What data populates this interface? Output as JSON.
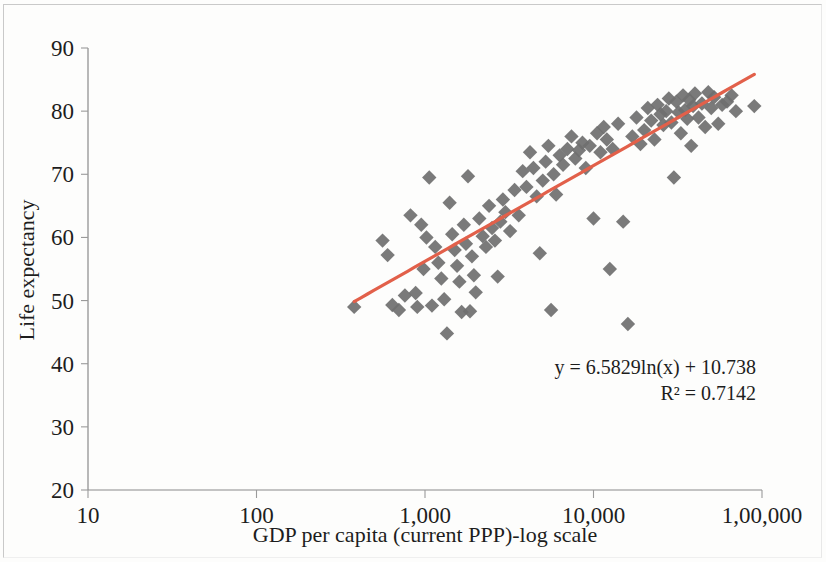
{
  "chart_data": {
    "type": "scatter",
    "title": "",
    "xlabel": "GDP per capita (current PPP)-log scale",
    "ylabel": "Life expectancy",
    "xscale": "log",
    "yscale": "linear",
    "xlim": [
      10,
      100000
    ],
    "ylim": [
      20,
      90
    ],
    "xticks": [
      10,
      100,
      1000,
      10000,
      100000
    ],
    "xtick_labels": [
      "10",
      "100",
      "1,000",
      "10,000",
      "1,00,000"
    ],
    "yticks": [
      20,
      30,
      40,
      50,
      60,
      70,
      80,
      90
    ],
    "ytick_labels": [
      "20",
      "30",
      "40",
      "50",
      "60",
      "70",
      "80",
      "90"
    ],
    "grid": false,
    "legend": null,
    "marker_shape": "diamond",
    "marker_color": "#6f6f6f",
    "trendline": {
      "type": "logarithmic",
      "equation": "y = 6.5829ln(x) + 10.738",
      "r_squared_label": "R² = 0.7142",
      "r_squared": 0.7142,
      "slope": 6.5829,
      "intercept": 10.738,
      "color": "#e2604a",
      "x_start": 380,
      "x_end": 90000
    },
    "annotations": [
      "y = 6.5829ln(x) + 10.738",
      "R² = 0.7142"
    ],
    "points": [
      [
        380,
        49.0
      ],
      [
        560,
        59.5
      ],
      [
        600,
        57.2
      ],
      [
        640,
        49.3
      ],
      [
        700,
        48.5
      ],
      [
        760,
        50.8
      ],
      [
        820,
        63.5
      ],
      [
        880,
        51.2
      ],
      [
        900,
        49.0
      ],
      [
        950,
        62.0
      ],
      [
        980,
        55.0
      ],
      [
        1020,
        60.0
      ],
      [
        1060,
        69.5
      ],
      [
        1100,
        49.2
      ],
      [
        1150,
        58.5
      ],
      [
        1200,
        56.0
      ],
      [
        1250,
        53.5
      ],
      [
        1300,
        50.2
      ],
      [
        1350,
        44.8
      ],
      [
        1400,
        65.5
      ],
      [
        1450,
        60.5
      ],
      [
        1500,
        58.0
      ],
      [
        1550,
        55.5
      ],
      [
        1600,
        53.0
      ],
      [
        1650,
        48.2
      ],
      [
        1700,
        62.0
      ],
      [
        1750,
        59.0
      ],
      [
        1800,
        69.7
      ],
      [
        1850,
        48.3
      ],
      [
        1900,
        57.0
      ],
      [
        1950,
        54.0
      ],
      [
        2000,
        51.3
      ],
      [
        2100,
        63.0
      ],
      [
        2200,
        60.2
      ],
      [
        2300,
        58.5
      ],
      [
        2400,
        65.0
      ],
      [
        2500,
        61.5
      ],
      [
        2600,
        59.5
      ],
      [
        2700,
        53.8
      ],
      [
        2800,
        62.5
      ],
      [
        2900,
        66.0
      ],
      [
        3000,
        64.0
      ],
      [
        3200,
        61.0
      ],
      [
        3400,
        67.5
      ],
      [
        3600,
        63.5
      ],
      [
        3800,
        70.5
      ],
      [
        4000,
        68.0
      ],
      [
        4200,
        73.5
      ],
      [
        4400,
        71.0
      ],
      [
        4600,
        66.5
      ],
      [
        4800,
        57.5
      ],
      [
        5000,
        69.0
      ],
      [
        5200,
        72.0
      ],
      [
        5400,
        74.5
      ],
      [
        5600,
        48.5
      ],
      [
        5800,
        70.0
      ],
      [
        6000,
        66.8
      ],
      [
        6300,
        73.0
      ],
      [
        6600,
        71.5
      ],
      [
        7000,
        74.0
      ],
      [
        7400,
        76.0
      ],
      [
        7800,
        72.5
      ],
      [
        8200,
        73.8
      ],
      [
        8600,
        75.0
      ],
      [
        9000,
        71.0
      ],
      [
        9500,
        74.5
      ],
      [
        10000,
        63.0
      ],
      [
        10500,
        76.5
      ],
      [
        11000,
        73.5
      ],
      [
        11500,
        77.5
      ],
      [
        12000,
        75.5
      ],
      [
        12500,
        55.0
      ],
      [
        13000,
        74.0
      ],
      [
        14000,
        78.0
      ],
      [
        15000,
        62.5
      ],
      [
        16000,
        46.3
      ],
      [
        17000,
        76.0
      ],
      [
        18000,
        79.0
      ],
      [
        19000,
        74.8
      ],
      [
        20000,
        77.0
      ],
      [
        21000,
        80.5
      ],
      [
        22000,
        78.5
      ],
      [
        23000,
        75.5
      ],
      [
        24000,
        81.0
      ],
      [
        25000,
        79.5
      ],
      [
        26000,
        77.8
      ],
      [
        27000,
        80.0
      ],
      [
        28000,
        82.0
      ],
      [
        29000,
        78.2
      ],
      [
        30000,
        69.5
      ],
      [
        31000,
        81.5
      ],
      [
        32000,
        79.8
      ],
      [
        33000,
        76.5
      ],
      [
        34000,
        82.5
      ],
      [
        35000,
        80.2
      ],
      [
        36000,
        78.8
      ],
      [
        37000,
        81.8
      ],
      [
        38000,
        74.5
      ],
      [
        39000,
        80.8
      ],
      [
        40000,
        82.8
      ],
      [
        42000,
        79.0
      ],
      [
        44000,
        81.2
      ],
      [
        46000,
        77.5
      ],
      [
        48000,
        83.0
      ],
      [
        50000,
        80.5
      ],
      [
        52000,
        82.2
      ],
      [
        55000,
        78.0
      ],
      [
        58000,
        81.0
      ],
      [
        62000,
        81.5
      ],
      [
        66000,
        82.5
      ],
      [
        70000,
        80.0
      ],
      [
        90000,
        80.8
      ]
    ]
  },
  "axes": {
    "y_title": "Life expectancy",
    "x_title": "GDP per capita (current PPP)-log scale"
  },
  "equation": {
    "line1": "y = 6.5829ln(x) + 10.738",
    "line2": "R² = 0.7142"
  },
  "colors": {
    "marker": "#6f6f6f",
    "trendline": "#e2604a",
    "axis": "#8a8a8a",
    "text": "#1d1d1d",
    "background": "#fdfdfc"
  }
}
